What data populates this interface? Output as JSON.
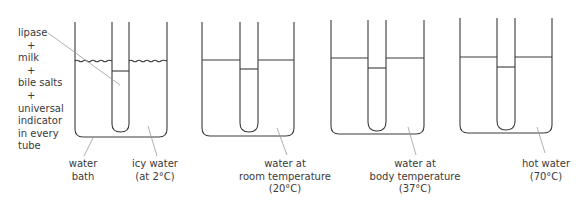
{
  "contents_label": {
    "lines": [
      "lipase",
      "+",
      "milk",
      "+",
      "bile salts",
      "+",
      "universal",
      "indicator",
      "in every",
      "tube"
    ]
  },
  "water_bath_label": [
    "water",
    "bath"
  ],
  "beakers": [
    {
      "id": "icy",
      "label_lines": [
        "icy water",
        "(at 2°C)"
      ],
      "temperature_c": 2,
      "surface": "wavy"
    },
    {
      "id": "room",
      "label_lines": [
        "water at",
        "room temperature",
        "(20°C)"
      ],
      "temperature_c": 20,
      "surface": "flat"
    },
    {
      "id": "body",
      "label_lines": [
        "water at",
        "body temperature",
        "(37°C)"
      ],
      "temperature_c": 37,
      "surface": "flat"
    },
    {
      "id": "hot",
      "label_lines": [
        "hot water",
        "(70°C)"
      ],
      "temperature_c": 70,
      "surface": "flat"
    }
  ],
  "colors": {
    "line": "#3a3a3a",
    "leader": "#9a9a9a",
    "text": "#3a3a3a"
  }
}
